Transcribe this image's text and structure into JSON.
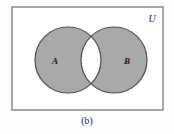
{
  "figure": {
    "caption": "(b)",
    "universe_label": "U",
    "set_a_label": "A",
    "set_b_label": "B"
  },
  "colors": {
    "shaded_fill": "#a9a9a9",
    "unshaded_fill": "#ffffff",
    "outline": "#4d4d4d",
    "box_border": "#7a7a7a",
    "page_background": "#fdfdfd",
    "text": "#1a1a1a"
  },
  "geometry": {
    "box": {
      "x": 12,
      "y": 7,
      "width": 151,
      "height": 103
    },
    "circle_a": {
      "cx": 68,
      "cy": 60,
      "r": 33
    },
    "circle_b": {
      "cx": 114,
      "cy": 60,
      "r": 33
    },
    "label_a": {
      "x": 55,
      "y": 64
    },
    "label_b": {
      "x": 127,
      "y": 64
    },
    "label_u": {
      "x": 152,
      "y": 22
    }
  }
}
